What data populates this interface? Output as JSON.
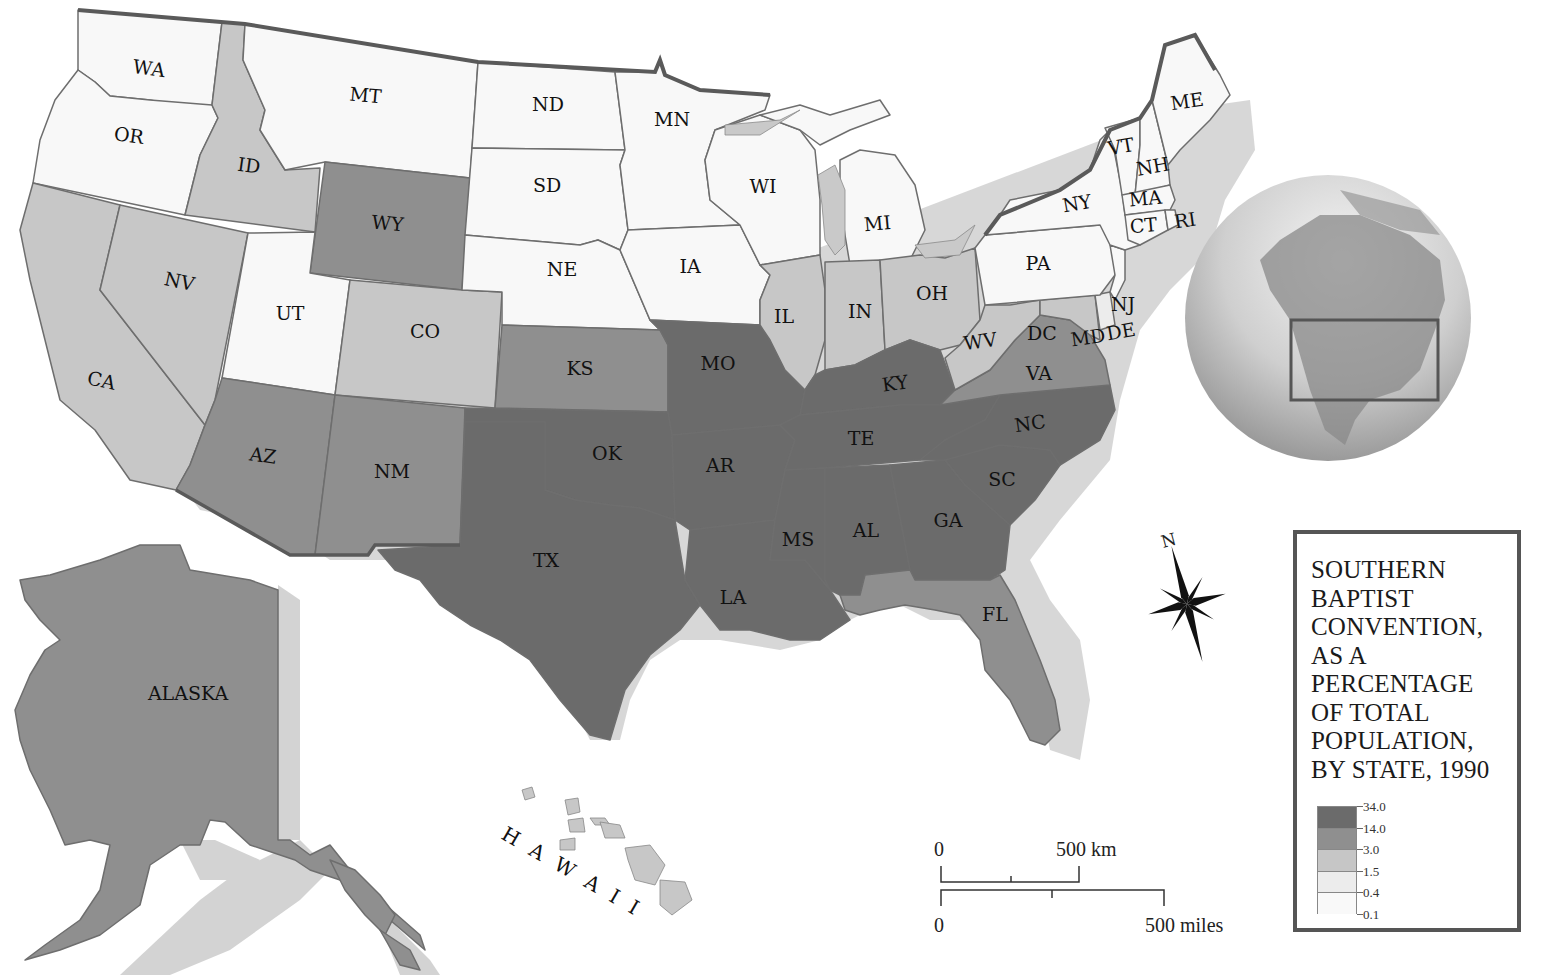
{
  "legend": {
    "title_lines": [
      "SOUTHERN",
      "BAPTIST",
      "CONVENTION,",
      "AS A",
      "PERCENTAGE",
      "OF TOTAL",
      "POPULATION,",
      "BY STATE, 1990"
    ],
    "breaks": [
      "34.0",
      "14.0",
      "3.0",
      "1.5",
      "0.4",
      "0.1"
    ],
    "classes": [
      {
        "range": "14.0–34.0",
        "color": "#6b6b6b"
      },
      {
        "range": "3.0–14.0",
        "color": "#8f8f8f"
      },
      {
        "range": "1.5–3.0",
        "color": "#c6c6c6"
      },
      {
        "range": "0.4–1.5",
        "color": "#ececec"
      },
      {
        "range": "0.1–0.4",
        "color": "#f9f9f9"
      }
    ]
  },
  "scale_bar": {
    "km_zero": "0",
    "km_label": "500 km",
    "mi_zero": "0",
    "mi_label": "500 miles"
  },
  "compass": {
    "north_label": "N"
  },
  "insets": {
    "alaska_label": "ALASKA",
    "hawaii_label": "H A W A I I"
  },
  "globe": {
    "icon": "globe-north-america-icon",
    "locator": "contiguous-us-box"
  },
  "colors": {
    "shadow": "#d2d2d2",
    "border": "#6e6e6e",
    "outer_border": "#5a5a5a"
  },
  "states": [
    {
      "abbr": "WA",
      "class": 4
    },
    {
      "abbr": "OR",
      "class": 4
    },
    {
      "abbr": "CA",
      "class": 2
    },
    {
      "abbr": "ID",
      "class": 2
    },
    {
      "abbr": "NV",
      "class": 2
    },
    {
      "abbr": "MT",
      "class": 4
    },
    {
      "abbr": "WY",
      "class": 1
    },
    {
      "abbr": "UT",
      "class": 4
    },
    {
      "abbr": "CO",
      "class": 2
    },
    {
      "abbr": "AZ",
      "class": 1
    },
    {
      "abbr": "NM",
      "class": 1
    },
    {
      "abbr": "ND",
      "class": 4
    },
    {
      "abbr": "SD",
      "class": 4
    },
    {
      "abbr": "NE",
      "class": 4
    },
    {
      "abbr": "KS",
      "class": 1
    },
    {
      "abbr": "OK",
      "class": 0
    },
    {
      "abbr": "TX",
      "class": 0
    },
    {
      "abbr": "MN",
      "class": 4
    },
    {
      "abbr": "IA",
      "class": 4
    },
    {
      "abbr": "MO",
      "class": 0
    },
    {
      "abbr": "AR",
      "class": 0
    },
    {
      "abbr": "LA",
      "class": 0
    },
    {
      "abbr": "WI",
      "class": 4
    },
    {
      "abbr": "IL",
      "class": 2
    },
    {
      "abbr": "MI",
      "class": 4
    },
    {
      "abbr": "IN",
      "class": 2
    },
    {
      "abbr": "OH",
      "class": 2
    },
    {
      "abbr": "KY",
      "class": 0
    },
    {
      "abbr": "TE",
      "class": 0
    },
    {
      "abbr": "MS",
      "class": 0
    },
    {
      "abbr": "AL",
      "class": 0
    },
    {
      "abbr": "GA",
      "class": 0
    },
    {
      "abbr": "FL",
      "class": 1
    },
    {
      "abbr": "SC",
      "class": 0
    },
    {
      "abbr": "NC",
      "class": 0
    },
    {
      "abbr": "VA",
      "class": 1
    },
    {
      "abbr": "WV",
      "class": 2
    },
    {
      "abbr": "DC",
      "class": 1
    },
    {
      "abbr": "MD",
      "class": 2
    },
    {
      "abbr": "DE",
      "class": 3
    },
    {
      "abbr": "PA",
      "class": 4
    },
    {
      "abbr": "NJ",
      "class": 4
    },
    {
      "abbr": "NY",
      "class": 4
    },
    {
      "abbr": "CT",
      "class": 4
    },
    {
      "abbr": "RI",
      "class": 4
    },
    {
      "abbr": "MA",
      "class": 4
    },
    {
      "abbr": "VT",
      "class": 4
    },
    {
      "abbr": "NH",
      "class": 4
    },
    {
      "abbr": "ME",
      "class": 4
    },
    {
      "abbr": "ALASKA",
      "class": 1
    },
    {
      "abbr": "HAWAII",
      "class": 2
    }
  ]
}
